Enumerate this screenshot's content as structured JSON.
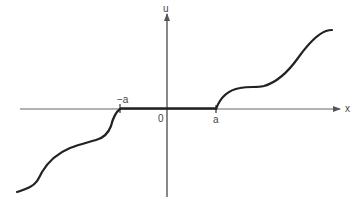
{
  "diagram": {
    "axis_labels": {
      "x": "x",
      "y": "u"
    },
    "tick_labels": {
      "neg_a": "−a",
      "origin": "0",
      "pos_a": "a"
    },
    "colors": {
      "axis": "#555555",
      "curve": "#222222",
      "background": "#ffffff"
    }
  }
}
